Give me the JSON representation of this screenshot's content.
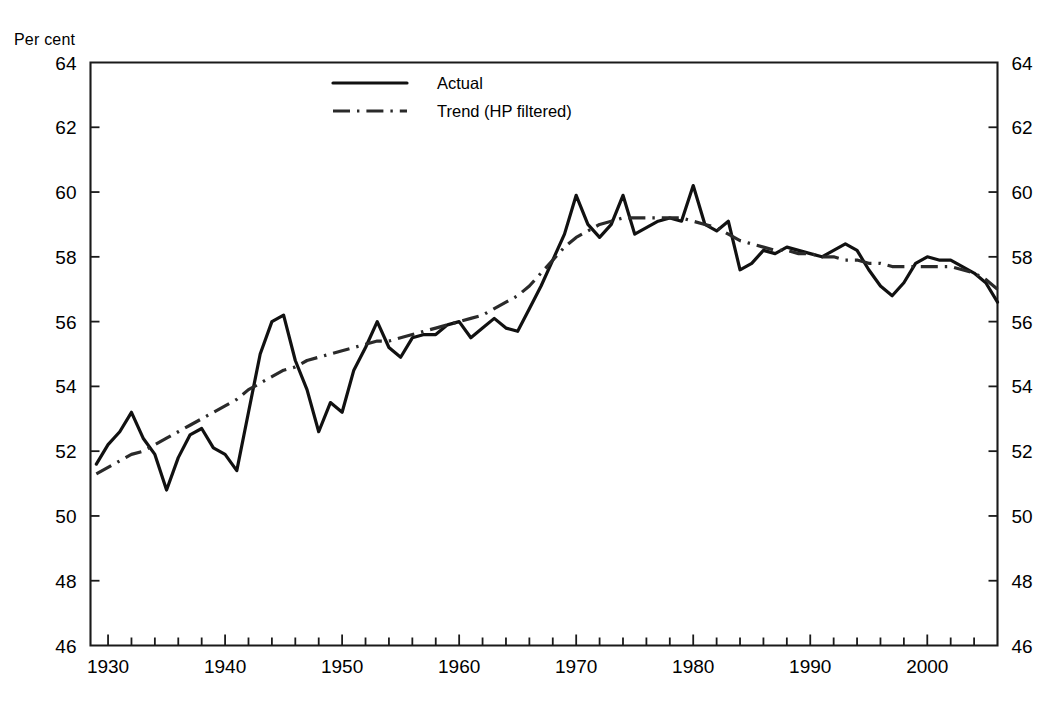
{
  "figure": {
    "unit_label": "Per cent"
  },
  "legend": {
    "position": "top-center-left",
    "entries": [
      {
        "label": "Actual",
        "style": "solid"
      },
      {
        "label": "Trend (HP filtered)",
        "style": "dash-dot"
      }
    ]
  },
  "chart_data": {
    "type": "line",
    "title": "",
    "subtitle": "",
    "xlabel": "",
    "ylabel": "Per cent",
    "grid": false,
    "legend_position": "inside-top-left",
    "xlim": [
      1928.5,
      2006
    ],
    "ylim": [
      46,
      64
    ],
    "xticks": [
      1930,
      1940,
      1950,
      1960,
      1970,
      1980,
      1990,
      2000
    ],
    "xtick_labels": [
      "1930",
      "1940",
      "1950",
      "1960",
      "1970",
      "1980",
      "1990",
      "2000"
    ],
    "x_minor_tick_interval": 2,
    "yticks": [
      46,
      48,
      50,
      52,
      54,
      56,
      58,
      60,
      62,
      64
    ],
    "ytick_labels": [
      "46",
      "48",
      "50",
      "52",
      "54",
      "56",
      "58",
      "60",
      "62",
      "64"
    ],
    "y_axis_both_sides": true,
    "x": [
      1928,
      1929,
      1930,
      1931,
      1932,
      1933,
      1934,
      1935,
      1936,
      1937,
      1938,
      1939,
      1940,
      1941,
      1942,
      1943,
      1944,
      1945,
      1946,
      1947,
      1948,
      1949,
      1950,
      1951,
      1952,
      1953,
      1954,
      1955,
      1956,
      1957,
      1958,
      1959,
      1960,
      1961,
      1962,
      1963,
      1964,
      1965,
      1966,
      1967,
      1968,
      1969,
      1970,
      1971,
      1972,
      1973,
      1974,
      1975,
      1976,
      1977,
      1978,
      1979,
      1980,
      1981,
      1982,
      1983,
      1984,
      1985,
      1986,
      1987,
      1988,
      1989,
      1990,
      1991,
      1992,
      1993,
      1994,
      1995,
      1996,
      1997,
      1998,
      1999,
      2000,
      2001,
      2002,
      2003,
      2004,
      2005,
      2006
    ],
    "series": [
      {
        "name": "Actual",
        "style": "solid",
        "color": "#111111",
        "values": [
          49.7,
          51.6,
          52.2,
          52.6,
          53.2,
          52.4,
          51.9,
          50.8,
          51.8,
          52.5,
          52.7,
          52.1,
          51.9,
          51.4,
          53.2,
          55.0,
          56.0,
          56.2,
          54.8,
          53.9,
          52.6,
          53.5,
          53.2,
          54.5,
          55.2,
          56.0,
          55.2,
          54.9,
          55.5,
          55.6,
          55.6,
          55.9,
          56.0,
          55.5,
          55.8,
          56.1,
          55.8,
          55.7,
          56.4,
          57.1,
          57.9,
          58.7,
          59.9,
          59.0,
          58.6,
          59.0,
          59.9,
          58.7,
          58.9,
          59.1,
          59.2,
          59.1,
          60.2,
          59.0,
          58.8,
          59.1,
          57.6,
          57.8,
          58.2,
          58.1,
          58.3,
          58.2,
          58.1,
          58.0,
          58.2,
          58.4,
          58.2,
          57.6,
          57.1,
          56.8,
          57.2,
          57.8,
          58.0,
          57.9,
          57.9,
          57.7,
          57.5,
          57.2,
          56.6
        ]
      },
      {
        "name": "Trend (HP filtered)",
        "style": "dash-dot",
        "color": "#2a2a2a",
        "values": [
          51.1,
          51.3,
          51.5,
          51.7,
          51.9,
          52.0,
          52.2,
          52.4,
          52.6,
          52.8,
          53.0,
          53.2,
          53.4,
          53.6,
          53.9,
          54.1,
          54.3,
          54.5,
          54.6,
          54.8,
          54.9,
          55.0,
          55.1,
          55.2,
          55.3,
          55.4,
          55.4,
          55.5,
          55.6,
          55.7,
          55.8,
          55.9,
          56.0,
          56.1,
          56.2,
          56.4,
          56.6,
          56.8,
          57.1,
          57.5,
          57.9,
          58.3,
          58.6,
          58.8,
          59.0,
          59.1,
          59.2,
          59.2,
          59.2,
          59.2,
          59.2,
          59.2,
          59.1,
          59.0,
          58.9,
          58.7,
          58.5,
          58.4,
          58.3,
          58.2,
          58.2,
          58.1,
          58.1,
          58.0,
          58.0,
          57.9,
          57.9,
          57.8,
          57.8,
          57.7,
          57.7,
          57.7,
          57.7,
          57.7,
          57.7,
          57.6,
          57.5,
          57.3,
          57.0
        ]
      }
    ]
  }
}
